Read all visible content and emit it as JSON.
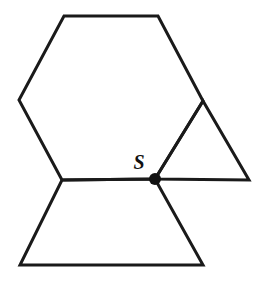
{
  "figure": {
    "background_color": "#ffffff",
    "stroke_color": "#1a1a1a",
    "stroke_width": 3,
    "canvas": {
      "width": 263,
      "height": 283
    },
    "labels": {
      "point_s": "S"
    },
    "points": {
      "hex_top_left": {
        "x": 64,
        "y": 16
      },
      "hex_top_right": {
        "x": 158,
        "y": 16
      },
      "hex_right": {
        "x": 203,
        "y": 101
      },
      "hex_bottom_right": {
        "x": 155,
        "y": 179
      },
      "hex_bottom_left": {
        "x": 62,
        "y": 180
      },
      "hex_left": {
        "x": 19,
        "y": 100
      },
      "tri_right": {
        "x": 249,
        "y": 180
      },
      "trap_bottom_left": {
        "x": 20,
        "y": 265
      },
      "trap_bottom_right": {
        "x": 203,
        "y": 265
      },
      "s": {
        "x": 155,
        "y": 179
      }
    },
    "shapes": [
      {
        "name": "hexagon",
        "vertices": "64,16 158,16 203,101 155,179 62,180 19,100"
      },
      {
        "name": "triangle",
        "vertices": "155,179 203,101 249,180"
      },
      {
        "name": "trapezoid",
        "vertices": "62,180 155,179 203,265 20,265"
      }
    ],
    "marker": {
      "name": "point-s-dot",
      "x": 155,
      "y": 179,
      "radius": 6,
      "color": "#111111"
    },
    "label_position": {
      "x": 139,
      "y": 169
    }
  }
}
